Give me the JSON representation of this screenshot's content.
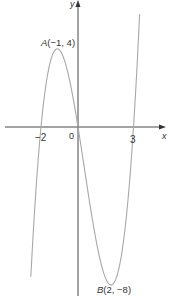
{
  "chart_data": {
    "type": "line",
    "title": "",
    "function": "y = x(x + 2)(x - 3)",
    "xlabel": "x",
    "ylabel": "y",
    "x_ticks": [
      {
        "value": -2,
        "label": "−2"
      },
      {
        "value": 0,
        "label": "0"
      },
      {
        "value": 3,
        "label": "3"
      }
    ],
    "roots": [
      -2,
      0,
      3
    ],
    "points": [
      {
        "name": "A",
        "x": -1,
        "y": 4,
        "label": "A(−1, 4)",
        "type": "local maximum"
      },
      {
        "name": "B",
        "x": 2,
        "y": -8,
        "label": "B(2, −8)",
        "type": "local minimum"
      }
    ],
    "x_range": [
      -2.55,
      3.33
    ],
    "grid": false
  },
  "labels": {
    "axis_x": "x",
    "axis_y": "y",
    "tick_neg2": "−2",
    "origin": "0",
    "tick_3": "3",
    "point_a_letter": "A",
    "point_a_coords": "(−1, 4)",
    "point_b_letter": "B",
    "point_b_coords": "(2, −8)"
  },
  "colors": {
    "axis": "#333333",
    "curve": "#a8a8a8",
    "text": "#333333"
  }
}
